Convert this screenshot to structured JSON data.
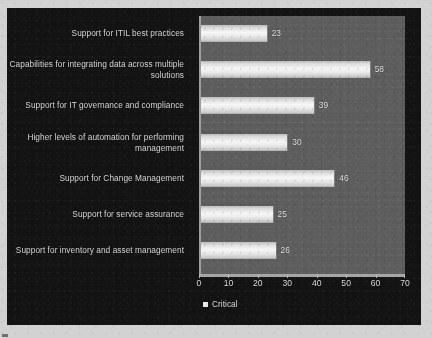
{
  "chart_data": {
    "type": "bar",
    "orientation": "horizontal",
    "title": "",
    "xlabel": "",
    "ylabel": "",
    "xlim": [
      0,
      70
    ],
    "xticks": [
      0,
      10,
      20,
      30,
      40,
      50,
      60,
      70
    ],
    "grid": false,
    "legend": {
      "position": "bottom-left",
      "entries": [
        {
          "name": "Critical",
          "color": "#f0f0f0"
        }
      ]
    },
    "categories": [
      "Support for ITIL best practices",
      "Capabilities for integrating data across multiple solutions",
      "Support for IT governance and compliance",
      "Higher levels of automation for performing management",
      "Support for Change Management",
      "Support for service assurance",
      "Support for inventory and asset management"
    ],
    "series": [
      {
        "name": "Critical",
        "values": [
          23,
          58,
          39,
          30,
          46,
          25,
          26
        ]
      }
    ],
    "data_labels": [
      "23",
      "58",
      "39",
      "30",
      "46",
      "25",
      "26"
    ]
  },
  "colors": {
    "page_background": "#d2d2d2",
    "panel_background": "#131313",
    "plot_background": "#5d5d5d",
    "bar_fill": "#f0f0f0",
    "text": "#dcdcdc",
    "axis": "#a6a6a6"
  }
}
